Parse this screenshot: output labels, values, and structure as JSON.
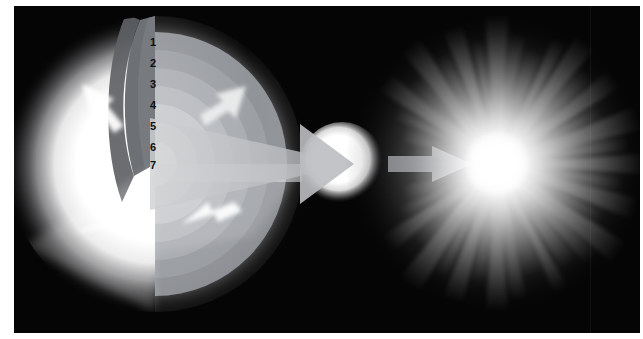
{
  "figure": {
    "background_color": "#050505",
    "page_background": "#ffffff",
    "width": 643,
    "height": 339
  },
  "left_panel": {
    "name": "star-cutaway",
    "description": "Cutaway of an evolved massive star showing seven concentric compositional shells",
    "center_x": 155,
    "center_y": 158,
    "glow_color": "#ffffff",
    "cut_face_color": "#6f7276",
    "shell_labels": [
      {
        "id": 1,
        "label": "1",
        "x": 152,
        "y": 36,
        "shell_color": "#8e9196"
      },
      {
        "id": 2,
        "label": "2",
        "x": 152,
        "y": 57,
        "shell_color": "#9a9da2"
      },
      {
        "id": 3,
        "label": "3",
        "x": 152,
        "y": 78,
        "shell_color": "#a8abb0"
      },
      {
        "id": 4,
        "label": "4",
        "x": 152,
        "y": 99,
        "shell_color": "#b6b9bd"
      },
      {
        "id": 5,
        "label": "5",
        "x": 152,
        "y": 120,
        "shell_color": "#c6c8cb"
      },
      {
        "id": 6,
        "label": "6",
        "x": 152,
        "y": 141,
        "shell_color": "#d8d9db"
      },
      {
        "id": 7,
        "label": "7",
        "x": 152,
        "y": 158,
        "shell_color": "#f2f2f3"
      }
    ],
    "callout_arrows": [
      {
        "name": "callout-arrow-upper-left",
        "direction": "down-right",
        "color": "#ffffff"
      },
      {
        "name": "callout-arrow-upper-right",
        "direction": "down-left",
        "color": "#e8e9ea"
      },
      {
        "name": "callout-arrow-lower-left",
        "direction": "up-right",
        "color": "#ffffff"
      },
      {
        "name": "callout-arrow-lower-right",
        "direction": "up-left",
        "color": "#ffffff"
      }
    ]
  },
  "transition_wedge": {
    "name": "magnification-cone",
    "color": "#b9bbbe",
    "from_x": 150,
    "from_y": 158,
    "to_x": 352,
    "to_y": 158
  },
  "middle_panel": {
    "name": "progenitor-star",
    "description": "Compact progenitor star before core collapse",
    "center_x": 342,
    "center_y": 158,
    "radius": 36,
    "color": "#ffffff"
  },
  "progress_arrow": {
    "name": "evolution-arrow",
    "direction": "right",
    "color": "#9a9da1",
    "start_x": 388,
    "end_x": 472,
    "y": 158
  },
  "right_panel": {
    "name": "supernova-explosion",
    "description": "Supernova explosion with radiating light rays",
    "center_x": 497,
    "center_y": 158,
    "core_color": "#ffffff",
    "ray_count": 44,
    "halo_radius": 150
  }
}
